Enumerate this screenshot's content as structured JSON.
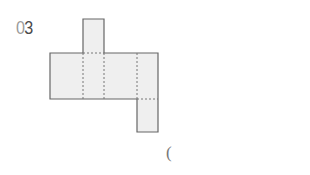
{
  "problem": {
    "number_digits": [
      "0",
      "3"
    ],
    "answer_open_paren": "("
  },
  "figure": {
    "type": "net-of-cuboid",
    "fill": "#efefef",
    "stroke": "#666666",
    "dash_stroke": "#777777"
  }
}
